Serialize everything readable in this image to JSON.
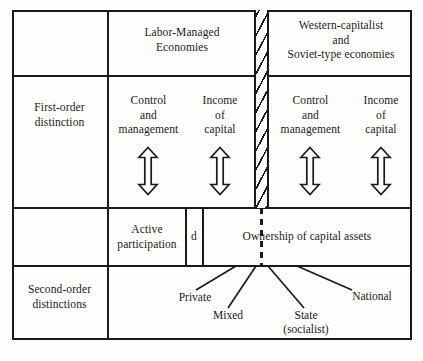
{
  "diagram": {
    "ink_color": "#1a1a1a",
    "paper_color": "#fdfdfc",
    "row_labels": {
      "top_left_blank": "",
      "first_order": "First-order\ndistinction",
      "second_order": "Second-order\ndistinctions"
    },
    "columns": {
      "left_heading": "Labor-Managed\nEconomies",
      "right_heading": "Western-capitalist\nand\nSoviet-type economies"
    },
    "first_order_cells": {
      "left_control": "Control\nand\nmanagement",
      "left_income": "Income\nof\ncapital",
      "right_control": "Control\nand\nmanagement",
      "right_income": "Income\nof\ncapital"
    },
    "middle_band_row": {
      "active_participation": "Active\nparticipation",
      "divider_letter": "d",
      "ownership": "Ownership of capital assets"
    },
    "second_order_leaves": [
      {
        "label": "Private"
      },
      {
        "label": "Mixed"
      },
      {
        "label": "State\n(socialist)"
      },
      {
        "label": "National"
      }
    ],
    "arrows": [
      {
        "name": "left-control-arrow"
      },
      {
        "name": "left-income-arrow"
      },
      {
        "name": "right-control-arrow"
      },
      {
        "name": "right-income-arrow"
      }
    ],
    "separator": {
      "kind": "hatched-vertical-band",
      "dashed_extension": true
    }
  }
}
